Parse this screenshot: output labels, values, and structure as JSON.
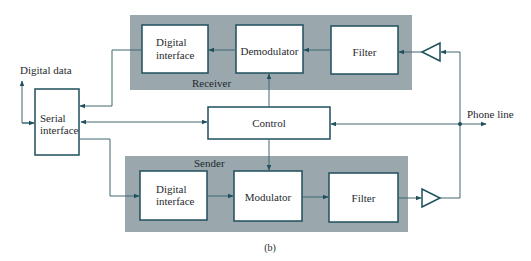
{
  "diagram": {
    "caption": "(b)",
    "colors": {
      "panel": "#9aa7ad",
      "stroke": "#1f4f5c",
      "line": "#3f6672",
      "text": "#1f2a2e"
    },
    "external_labels": {
      "digital_data": "Digital data",
      "phone_line": "Phone line"
    },
    "groups": {
      "receiver": {
        "label": "Receiver"
      },
      "sender": {
        "label": "Sender"
      }
    },
    "blocks": {
      "rx_digital_interface": {
        "line1": "Digital",
        "line2": "interface"
      },
      "demodulator": {
        "label": "Demodulator"
      },
      "rx_filter": {
        "label": "Filter"
      },
      "serial_interface": {
        "line1": "Serial",
        "line2": "interface"
      },
      "control": {
        "label": "Control"
      },
      "tx_digital_interface": {
        "line1": "Digital",
        "line2": "interface"
      },
      "modulator": {
        "label": "Modulator"
      },
      "tx_filter": {
        "label": "Filter"
      }
    },
    "amplifiers": {
      "rx": {
        "direction": "left"
      },
      "tx": {
        "direction": "right"
      }
    }
  }
}
